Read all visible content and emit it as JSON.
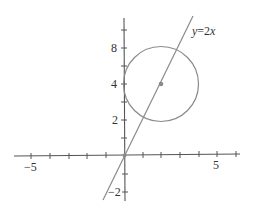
{
  "diagram": {
    "title": "",
    "colors": {
      "axis": "#555555",
      "curve": "#8a8a8a",
      "point": "#8a8a8a",
      "text": "#333333",
      "background": "#ffffff"
    },
    "x_axis": {
      "tick_labels": [
        "−5",
        "5"
      ],
      "range": [
        -6,
        6
      ]
    },
    "y_axis": {
      "tick_labels": [
        "8",
        "4",
        "2",
        "−2"
      ],
      "range": [
        -2,
        8
      ]
    },
    "line": {
      "label": "y=2x",
      "label_var": "y",
      "label_rest": "=2x"
    },
    "circle": {
      "center_label": "",
      "description": "circle centered on the line y=2x"
    }
  }
}
